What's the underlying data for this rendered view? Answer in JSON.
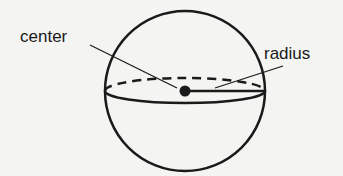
{
  "diagram": {
    "labels": {
      "center": "center",
      "radius": "radius"
    },
    "colors": {
      "background": "#f4f4f2",
      "stroke": "#1a1a1a"
    }
  }
}
